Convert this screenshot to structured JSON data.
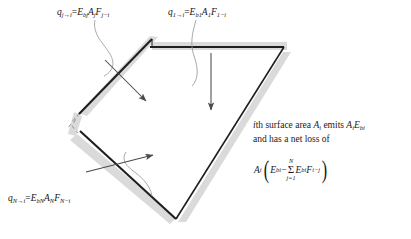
{
  "figure": {
    "name": "radiation-enclosure-diagram",
    "width": 411,
    "height": 239,
    "background": "#ffffff",
    "line_color": "#1a1a1a",
    "shadow_color": "#d9d9d9",
    "leader_color": "#8a8a8a",
    "arrow_color": "#4a4a4a"
  },
  "labels": {
    "eq_j": {
      "q": "q",
      "sub_j_to_i": "j→i",
      "equals": "=",
      "E": "E",
      "sub_bj": "bj",
      "A": "A",
      "sub_j": "j",
      "F": "F",
      "sub_j_minus_i": "j−i",
      "plain": "q_{j→i} = E_{bj} A_j F_{j−i}"
    },
    "eq_1": {
      "q": "q",
      "sub_1_to_i": "1→i",
      "equals": "=",
      "E": "E",
      "sub_b1": "b1",
      "A": "A",
      "sub_1": "1",
      "F": "F",
      "sub_1_minus_i": "1−i",
      "plain": "q_{1→i} = E_{b1} A_1 F_{1−i}"
    },
    "eq_N": {
      "q": "q",
      "sub_N_to_i": "N→i",
      "equals": "=",
      "E": "E",
      "sub_bN": "bN",
      "A": "A",
      "sub_N": "N",
      "F": "F",
      "sub_N_minus_i": "N−i",
      "plain": "q_{N→i} = E_{bN} A_N F_{N−i}"
    }
  },
  "description": {
    "line1_a": "i",
    "line1_b": "th surface area ",
    "line1_c": "A",
    "line1_sub": "i",
    "line1_d": " emits ",
    "line1_e": "A",
    "line1_sub2": "i",
    "line1_f": "E",
    "line1_sub3": "bi",
    "line2": "and has a net loss of",
    "plain": "i th surface area A_i emits A_i E_bi and has a net loss of"
  },
  "net_loss": {
    "A": "A",
    "sub_i": "i",
    "open_paren": "(",
    "E1": "E",
    "sub_bi_1": "bi",
    "minus": "−",
    "sum_upper": "N",
    "sum_symbol": "Σ",
    "sum_lower": "j=1",
    "E2": "E",
    "sub_bi_2": "bi",
    "F": "F",
    "sub_i_minus_j": "i−j",
    "close_paren": ")",
    "plain": "A_i ( E_bi − Σ_{j=1}^{N} E_bi F_{i−j} )"
  },
  "surfaces": [
    {
      "name": "surface-j",
      "kind": "solid-thick",
      "note": "upper-left inclined surface"
    },
    {
      "name": "surface-1",
      "kind": "solid-thick",
      "note": "top horizontal surface"
    },
    {
      "name": "surface-N",
      "kind": "solid-thick",
      "note": "lower-left inclined surface"
    },
    {
      "name": "surface-right-upper",
      "kind": "solid-thin",
      "note": "right descending edge"
    },
    {
      "name": "surface-bottom",
      "kind": "solid-thin",
      "note": "bottom-right ascending edge"
    },
    {
      "name": "surface-dashed-left",
      "kind": "dashed",
      "note": "omitted surfaces on left"
    }
  ],
  "arrows": [
    {
      "name": "arrow-from-surface-j",
      "direction": "down-right"
    },
    {
      "name": "arrow-from-surface-1",
      "direction": "down"
    },
    {
      "name": "arrow-from-surface-N",
      "direction": "up-right"
    }
  ]
}
